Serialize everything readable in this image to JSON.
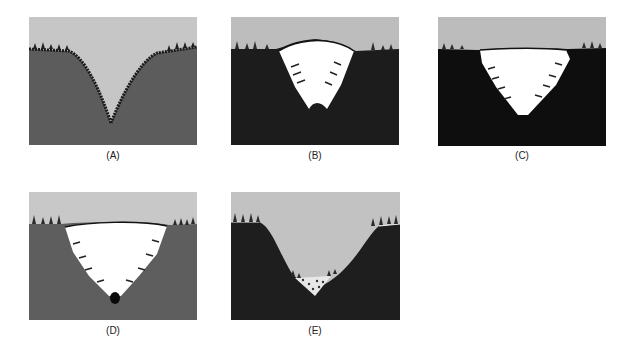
{
  "figure": {
    "panels": [
      {
        "id": "A",
        "label": "(A)",
        "x": 29,
        "y": 17,
        "w": 168,
        "h": 128,
        "rock": "#5c5c5c",
        "sky": "#c6c6c6",
        "stage": "v-shaped-river-valley"
      },
      {
        "id": "B",
        "label": "(B)",
        "x": 231,
        "y": 17,
        "w": 168,
        "h": 128,
        "rock": "#1c1c1c",
        "sky": "#bdbdbd",
        "stage": "glacier-fills-valley"
      },
      {
        "id": "C",
        "label": "(C)",
        "x": 438,
        "y": 17,
        "w": 168,
        "h": 129,
        "rock": "#0e0e0e",
        "sky": "#bcbcbc",
        "stage": "glacier-erodes-valley-walls"
      },
      {
        "id": "D",
        "label": "(D)",
        "x": 29,
        "y": 192,
        "w": 168,
        "h": 128,
        "rock": "#5e5e5e",
        "sky": "#c8c8c8",
        "stage": "glacier-widens-valley"
      },
      {
        "id": "E",
        "label": "(E)",
        "x": 231,
        "y": 192,
        "w": 169,
        "h": 128,
        "rock": "#1e1e1e",
        "sky": "#c2c2c2",
        "stage": "u-shaped-glacial-valley-with-deposits"
      }
    ],
    "colors": {
      "ice": "#ffffff",
      "arrow": "#222222",
      "trees": "#2a2a2a",
      "deposit": "#e8e8e8"
    }
  }
}
